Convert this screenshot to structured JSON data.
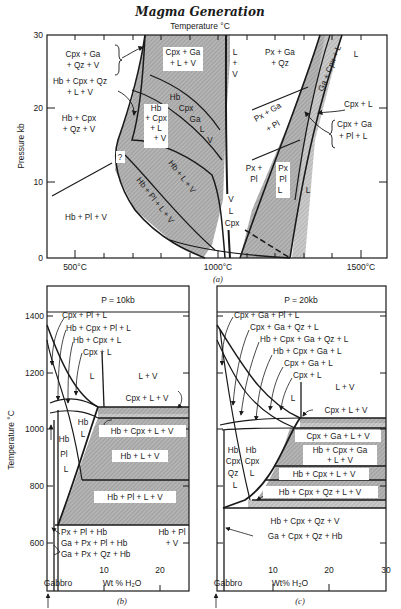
{
  "title": "Magma Generation",
  "colors": {
    "line": "#1a1a1a",
    "shade": "#a8a8a8",
    "shade_light": "#c4c4c4",
    "background": "#ffffff"
  },
  "panel_a": {
    "caption": "(a)",
    "x_axis_title": "Temperature °C",
    "y_axis_title": "Pressure kb",
    "x_ticks": [
      "500°C",
      "1000°C",
      "1500°C"
    ],
    "y_ticks": [
      "0",
      "10",
      "20",
      "30"
    ],
    "labels": {
      "cpx_ga_qz_v_1": "Cpx + Ga",
      "cpx_ga_qz_v_2": "+ Qz + V",
      "hb_cpx_qz_l_v_1": "Hb + Cpx + Qz",
      "hb_cpx_qz_l_v_2": "+ L + V",
      "hb_cpx_qz_v_1": "Hb + Cpx",
      "hb_cpx_qz_v_2": "+ Qz + V",
      "cpx_ga_l_v_1": "Cpx + Ga",
      "cpx_ga_l_v_2": "+ L + V",
      "l_v_1": "L",
      "l_v_2": "+",
      "l_v_3": "V",
      "px_ga_qz_1": "Px + Ga",
      "px_ga_qz_2": "+ Qz",
      "l_top": "L",
      "ga_cpx_l": "Ga + Cpx + L",
      "hb_cpx_l_v_1": "Hb",
      "hb_cpx_l_v_2": "+ Cpx",
      "hb_cpx_l_v_3": "+ L",
      "hb_cpx_l_v_4": "+ V",
      "hb_cpx_ga_l_v_1": "Hb",
      "hb_cpx_ga_l_v_2": "Cpx",
      "hb_cpx_ga_l_v_3": "Ga",
      "hb_cpx_ga_l_v_4": "L",
      "hb_cpx_ga_l_v_5": "V",
      "question": "?",
      "hb_l_v": "Hb + L + V",
      "hb_pl_l_v": "Hb + Pl + L + V",
      "hb_pl_v": "Hb + Pl + V",
      "v_l_cpx_1": "V",
      "v_l_cpx_2": "L",
      "v_l_cpx_3": "Cpx",
      "px_ga_pl_1": "Px + Ga",
      "px_ga_pl_2": "+ Pl",
      "cpx_l": "Cpx + L",
      "cpx_ga_pl_l_1": "Cpx + Ga",
      "cpx_ga_pl_l_2": "+ Pl + L",
      "px_pl_1": "Px +",
      "px_pl_2": "Pl",
      "px_pl_l_1": "Px",
      "px_pl_l_2": "Pl",
      "px_pl_l_3": "L",
      "l_right": "L"
    }
  },
  "panel_b": {
    "caption": "(b)",
    "header": "P = 10kb",
    "y_axis_title": "Temperature °C",
    "x_axis_title": "Wt % H₂O",
    "x_ticks": [
      "10",
      "20"
    ],
    "y_ticks": [
      "600",
      "800",
      "1000",
      "1200",
      "1400"
    ],
    "gabbro_label": "Gabbro",
    "labels": {
      "cpx_pl_l": "Cpx + Pl + L",
      "hb_cpx_pl_l": "Hb + Cpx + Pl + L",
      "hb_cpx_l": "Hb + Cpx + L",
      "cpx_l": "Cpx + L",
      "l": "L",
      "l_v": "L + V",
      "cpx_l_v": "Cpx + L + V",
      "hb_l_1": "Hb",
      "hb_l_2": "L",
      "hb_cpx_l_v": "Hb + Cpx + L + V",
      "hb_pl_l_1": "Hb",
      "hb_pl_l_2": "Pl",
      "hb_pl_l_3": "L",
      "hb_l_v": "Hb + L + V",
      "hb_pl_l_v": "Hb + Pl + L + V",
      "px_pl_hb": "Px + Pl + Hb",
      "ga_px_pl_hb": "Ga + Px + Pl + Hb",
      "ga_px_qz_hb": "Ga + Px + Qz + Hb",
      "hb_pl_v_1": "Hb + Pl",
      "hb_pl_v_2": "+ V"
    }
  },
  "panel_c": {
    "caption": "(c)",
    "header": "P = 20kb",
    "x_axis_title": "Wt% H₂O",
    "x_ticks": [
      "10",
      "20",
      "30"
    ],
    "gabbro_label": "Gabbro",
    "labels": {
      "cpx_ga_pl_l": "Cpx + Ga + Pl + L",
      "cpx_ga_qz_l": "Cpx + Ga + Qz + L",
      "hb_cpx_ga_qz_l": "Hb + Cpx + Ga + Qz + L",
      "hb_cpx_ga_l": "Hb + Cpx + Ga + L",
      "cpx_ga_l": "Cpx + Ga + L",
      "cpx_l": "Cpx + L",
      "l": "L",
      "l_v": "L + V",
      "cpx_l_v": "Cpx + L + V",
      "cpx_ga_l_v": "Cpx + Ga + L + V",
      "hb_cpx_ga_l_v_1": "Hb + Cpx + Ga",
      "hb_cpx_ga_l_v_2": "+ L + V",
      "hb_cpx_l_v": "Hb + Cpx + L + V",
      "hb_cpx_qz_l_v": "Hb + Cpx + Qz + L + V",
      "hb_cpx_qz_l_1": "Hb",
      "hb_cpx_qz_l_2": "Cpx",
      "hb_cpx_qz_l_3": "Qz",
      "hb_cpx_qz_l_4": "L",
      "hb_cpx_l_1": "Hb",
      "hb_cpx_l_2": "Cpx",
      "hb_cpx_l_3": "L",
      "hb_cpx_qz_v": "Hb + Cpx + Qz + V",
      "ga_cpx_qz_hb": "Ga + Cpx + Qz + Hb"
    }
  }
}
